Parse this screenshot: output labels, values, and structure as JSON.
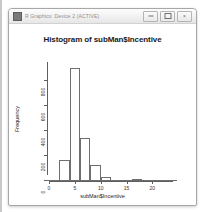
{
  "window": {
    "title": "R Graphics: Device 2 (ACTIVE)",
    "icon": "r-app-icon",
    "controls": [
      {
        "name": "minimize",
        "glyph": ""
      },
      {
        "name": "maximize",
        "glyph": ""
      },
      {
        "name": "close",
        "glyph": "×"
      }
    ]
  },
  "chart_data": {
    "type": "bar",
    "title": "Histogram of subMan$Incentive",
    "xlabel": "subMan$Incentive",
    "ylabel": "Frequency",
    "grid": false,
    "legend": null,
    "xlim": [
      0,
      24
    ],
    "ylim": [
      0,
      900
    ],
    "xticks": [
      0,
      5,
      10,
      15,
      20
    ],
    "xtick_labels": [
      "0",
      "5",
      "10",
      "15",
      "20"
    ],
    "yticks": [
      0,
      200,
      400,
      600,
      800
    ],
    "ytick_labels": [
      "0",
      "200",
      "400",
      "600",
      "800"
    ],
    "bin_width": 2,
    "bin_edges": [
      2,
      4,
      6,
      8,
      10,
      12,
      14,
      16,
      18,
      20,
      22,
      24
    ],
    "categories": [
      "2-4",
      "4-6",
      "6-8",
      "8-10",
      "10-12",
      "12-14",
      "14-16",
      "16-18",
      "18-20",
      "20-22",
      "22-24"
    ],
    "values": [
      170,
      900,
      340,
      125,
      35,
      8,
      4,
      18,
      2,
      1,
      1
    ]
  }
}
